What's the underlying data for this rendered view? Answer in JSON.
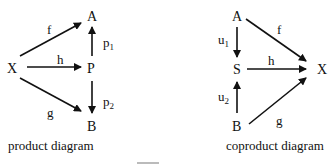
{
  "product": {
    "nodes": {
      "X": "X",
      "A": "A",
      "P": "P",
      "B": "B"
    },
    "arrows": {
      "f": "f",
      "h": "h",
      "g": "g",
      "p1": "p",
      "p1_sub": "1",
      "p2": "p",
      "p2_sub": "2"
    },
    "caption": "product diagram"
  },
  "coproduct": {
    "nodes": {
      "A": "A",
      "S": "S",
      "B": "B",
      "X": "X"
    },
    "arrows": {
      "f": "f",
      "h": "h",
      "g": "g",
      "u1": "u",
      "u1_sub": "1",
      "u2": "u",
      "u2_sub": "2"
    },
    "caption": "coproduct diagram"
  },
  "figure_caption_fragment": "Figure"
}
